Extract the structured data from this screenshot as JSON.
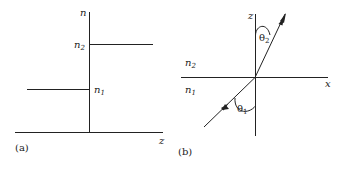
{
  "panel_a": {
    "caption": "(a)",
    "y_axis_label": "n",
    "x_axis_label": "z",
    "levels": [
      {
        "label": "n",
        "sub": "2",
        "side": "right"
      },
      {
        "label": "n",
        "sub": "1",
        "side": "left"
      }
    ]
  },
  "panel_b": {
    "caption": "(b)",
    "z_axis_label": "z",
    "x_axis_label": "x",
    "upper_medium": {
      "label": "n",
      "sub": "2"
    },
    "lower_medium": {
      "label": "n",
      "sub": "1"
    },
    "angles": [
      {
        "label": "θ",
        "sub": "2",
        "region": "upper"
      },
      {
        "label": "θ",
        "sub": "1",
        "region": "lower"
      }
    ]
  }
}
